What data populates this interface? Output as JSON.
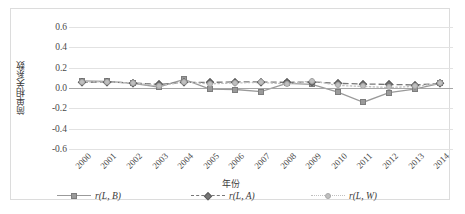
{
  "chart_data": {
    "type": "line",
    "title": "",
    "xlabel": "年份",
    "ylabel": "简单相关系数",
    "ylim": [
      -0.6,
      0.6
    ],
    "yticks": [
      "0.6",
      "0.4",
      "0.2",
      "0.0",
      "-0.2",
      "-0.4",
      "-0.6"
    ],
    "ytick_values": [
      0.6,
      0.4,
      0.2,
      0.0,
      -0.2,
      -0.4,
      -0.6
    ],
    "grid": true,
    "legend_position": "bottom",
    "categories": [
      "2000",
      "2001",
      "2002",
      "2003",
      "2004",
      "2005",
      "2006",
      "2007",
      "2008",
      "2009",
      "2010",
      "2011",
      "2012",
      "2013",
      "2014"
    ],
    "series": [
      {
        "name": "r(L, B)",
        "style": "solid",
        "marker": "square",
        "color": "#9a9a9a",
        "values": [
          0.07,
          0.065,
          0.045,
          0.01,
          0.085,
          -0.01,
          -0.015,
          -0.035,
          0.045,
          0.035,
          -0.04,
          -0.14,
          -0.045,
          -0.01,
          0.045
        ]
      },
      {
        "name": "r(L, A)",
        "style": "dashed",
        "marker": "diamond",
        "color": "#777777",
        "values": [
          0.055,
          0.06,
          0.05,
          0.035,
          0.055,
          0.055,
          0.06,
          0.06,
          0.055,
          0.06,
          0.045,
          0.04,
          0.035,
          0.03,
          0.045
        ]
      },
      {
        "name": "r(L, W)",
        "style": "dotted",
        "marker": "circle",
        "color": "#c0c0c0",
        "values": [
          0.06,
          0.06,
          0.05,
          0.02,
          0.06,
          0.04,
          0.05,
          0.055,
          0.04,
          0.07,
          0.025,
          0.015,
          0.005,
          0.015,
          0.045
        ]
      }
    ]
  },
  "legend": {
    "items": [
      {
        "label": "r(L, B)"
      },
      {
        "label": "r(L, A)"
      },
      {
        "label": "r(L, W)"
      }
    ]
  },
  "axes": {
    "y_title": "简单相关系数",
    "x_title": "年份"
  },
  "colors": {
    "series_b": "#9a9a9a",
    "series_a": "#777777",
    "series_w": "#c0c0c0",
    "grid": "#e2e2e2",
    "zero_axis": "#a6a6a6",
    "frame": "#dcdcdc"
  }
}
